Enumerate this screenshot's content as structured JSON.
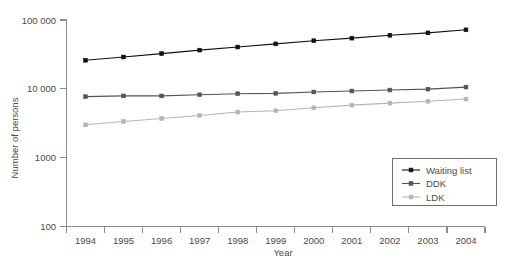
{
  "chart_data": {
    "type": "line",
    "title": "",
    "xlabel": "Year",
    "ylabel": "Number of persons",
    "x": [
      1994,
      1995,
      1996,
      1997,
      1998,
      1999,
      2000,
      2001,
      2002,
      2003,
      2004
    ],
    "xtick_labels": [
      "1994",
      "1995",
      "1996",
      "1997",
      "1998",
      "1999",
      "2000",
      "2001",
      "2002",
      "2003",
      "2004"
    ],
    "ytick_labels": [
      "100",
      "1000",
      "10 000",
      "100 000"
    ],
    "ytick_values": [
      100,
      1000,
      10000,
      100000
    ],
    "yscale": "log",
    "ylim": [
      100,
      100000
    ],
    "grid": false,
    "legend_position": "bottom-right",
    "series": [
      {
        "name": "Waiting list",
        "color": "#111111",
        "values": [
          26000,
          29000,
          32500,
          36500,
          40500,
          45000,
          50000,
          54500,
          60000,
          65000,
          72000
        ]
      },
      {
        "name": "DDK",
        "color": "#555555",
        "values": [
          7700,
          7900,
          7900,
          8200,
          8500,
          8600,
          9000,
          9300,
          9600,
          9900,
          10600
        ]
      },
      {
        "name": "LDK",
        "color": "#b5b5b5",
        "values": [
          3000,
          3350,
          3700,
          4100,
          4600,
          4800,
          5300,
          5800,
          6200,
          6600,
          7100
        ]
      }
    ]
  },
  "legend": {
    "entries": [
      {
        "label": "Waiting list"
      },
      {
        "label": "DDK"
      },
      {
        "label": "LDK"
      }
    ]
  }
}
